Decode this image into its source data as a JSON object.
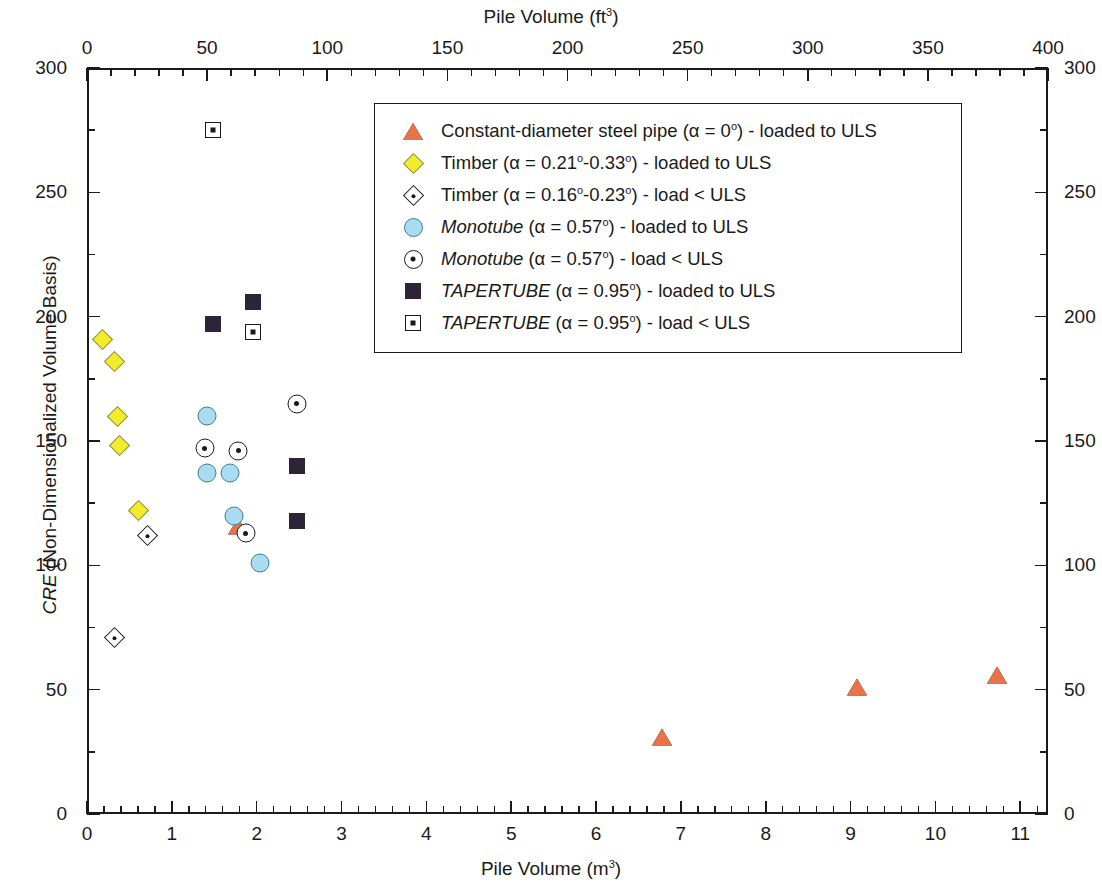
{
  "chart_data": {
    "type": "scatter",
    "title": "",
    "xlabel": "Pile Volume (m3)",
    "xlabel_top": "Pile Volume (ft3)",
    "ylabel": "CRE (Non-Dimensionalized Volume Basis)",
    "xlim": [
      0,
      11.327
    ],
    "xlim_top": [
      0,
      400
    ],
    "ylim": [
      0,
      300
    ],
    "x_ticks_bottom": [
      "0",
      "1",
      "2",
      "3",
      "4",
      "5",
      "6",
      "7",
      "8",
      "9",
      "10",
      "11"
    ],
    "x_tick_values_bottom": [
      0,
      1,
      2,
      3,
      4,
      5,
      6,
      7,
      8,
      9,
      10,
      11
    ],
    "x_ticks_top": [
      "0",
      "50",
      "100",
      "150",
      "200",
      "250",
      "300",
      "350",
      "400"
    ],
    "x_tick_values_top": [
      0,
      50,
      100,
      150,
      200,
      250,
      300,
      350,
      400
    ],
    "y_ticks": [
      "0",
      "50",
      "100",
      "150",
      "200",
      "250",
      "300"
    ],
    "y_tick_values": [
      0,
      50,
      100,
      150,
      200,
      250,
      300
    ],
    "y_ticks_right": [
      "0",
      "50",
      "100",
      "150",
      "200",
      "250",
      "300"
    ],
    "grid": false,
    "legend_position": "upper center",
    "minor_ticks_per_major_x_bottom": 5,
    "minor_ticks_per_major_x_top": 5,
    "minor_ticks_per_major_y": 2,
    "series": [
      {
        "name": "Constant-diameter steel pipe (α = 0º) - loaded to ULS",
        "marker": "triangle",
        "fill": "#e8734a",
        "edge": "#1a1a1a",
        "open": false,
        "points": [
          {
            "x": 1.78,
            "y": 116
          },
          {
            "x": 6.78,
            "y": 31
          },
          {
            "x": 9.08,
            "y": 51
          },
          {
            "x": 10.73,
            "y": 56
          }
        ]
      },
      {
        "name": "Timber (α = 0.21º-0.33º) - loaded to ULS",
        "marker": "diamond",
        "fill": "#f2ec2a",
        "edge": "#8a8a4a",
        "open": false,
        "points": [
          {
            "x": 0.27,
            "y": 188
          },
          {
            "x": 0.41,
            "y": 179
          },
          {
            "x": 0.45,
            "y": 157
          },
          {
            "x": 0.47,
            "y": 145
          },
          {
            "x": 0.7,
            "y": 119
          }
        ]
      },
      {
        "name": "Timber (α = 0.16º-0.23º) - load < ULS",
        "marker": "diamond",
        "fill": "#ffffff",
        "edge": "#1a1a1a",
        "open": true,
        "points": [
          {
            "x": 0.41,
            "y": 68
          },
          {
            "x": 0.8,
            "y": 109
          }
        ]
      },
      {
        "name": "Monotube (α = 0.57º) - loaded to ULS",
        "marker": "circle",
        "fill": "#a9dcf0",
        "edge": "#3d7d93",
        "open": false,
        "points": [
          {
            "x": 1.42,
            "y": 160
          },
          {
            "x": 1.41,
            "y": 137
          },
          {
            "x": 1.69,
            "y": 137
          },
          {
            "x": 1.73,
            "y": 120
          },
          {
            "x": 2.04,
            "y": 101
          }
        ]
      },
      {
        "name": "Monotube (α = 0.57º) - load < ULS",
        "marker": "circle-dot",
        "fill": "#ffffff",
        "edge": "#1a1a1a",
        "open": true,
        "points": [
          {
            "x": 1.39,
            "y": 147
          },
          {
            "x": 1.78,
            "y": 146
          },
          {
            "x": 1.87,
            "y": 113
          },
          {
            "x": 2.47,
            "y": 165
          }
        ]
      },
      {
        "name": "TAPERTUBE (α = 0.95º) - loaded to ULS",
        "marker": "square",
        "fill": "#2d2438",
        "edge": "#2d2438",
        "open": false,
        "points": [
          {
            "x": 1.48,
            "y": 197
          },
          {
            "x": 1.96,
            "y": 206
          },
          {
            "x": 2.47,
            "y": 140
          },
          {
            "x": 2.47,
            "y": 118
          }
        ]
      },
      {
        "name": "TAPERTUBE (α = 0.95º) - load < ULS",
        "marker": "square-dot",
        "fill": "#ffffff",
        "edge": "#1a1a1a",
        "open": true,
        "points": [
          {
            "x": 1.48,
            "y": 275
          },
          {
            "x": 1.96,
            "y": 194
          }
        ]
      }
    ]
  },
  "axes": {
    "top_title_main": "Pile Volume (ft",
    "top_title_sup": "3",
    "top_title_end": ")",
    "bottom_title_main": "Pile Volume (m",
    "bottom_title_sup": "3",
    "bottom_title_end": ")",
    "left_title_italic": "CRE",
    "left_title_rest": " (Non-Dimensionalized Volume Basis)"
  },
  "legend": {
    "entries": [
      {
        "pre": "",
        "italic": "",
        "text": "Constant-diameter steel pipe (α = 0",
        "sup": "o",
        "post": ") - loaded to ULS",
        "marker": "triangle"
      },
      {
        "pre": "",
        "italic": "",
        "text": "Timber (α = 0.21",
        "sup": "o",
        "mid": "-0.33",
        "sup2": "o",
        "post": ") - loaded to ULS",
        "marker": "diamond-filled"
      },
      {
        "pre": "",
        "italic": "",
        "text": "Timber (α = 0.16",
        "sup": "o",
        "mid": "-0.23",
        "sup2": "o",
        "post": ") - load < ULS",
        "marker": "diamond-open"
      },
      {
        "pre": "",
        "italic": "Monotube",
        "text": " (α = 0.57",
        "sup": "o",
        "post": ") - loaded to ULS",
        "marker": "circle-filled"
      },
      {
        "pre": "",
        "italic": "Monotube",
        "text": " (α = 0.57",
        "sup": "o",
        "post": ") - load < ULS",
        "marker": "circle-dot"
      },
      {
        "pre": "",
        "italic": "TAPERTUBE",
        "text": " (α = 0.95",
        "sup": "o",
        "post": ") - loaded to ULS",
        "marker": "square-filled"
      },
      {
        "pre": "",
        "italic": "TAPERTUBE",
        "text": " (α = 0.95",
        "sup": "o",
        "post": ") - load < ULS",
        "marker": "square-dot"
      }
    ]
  }
}
